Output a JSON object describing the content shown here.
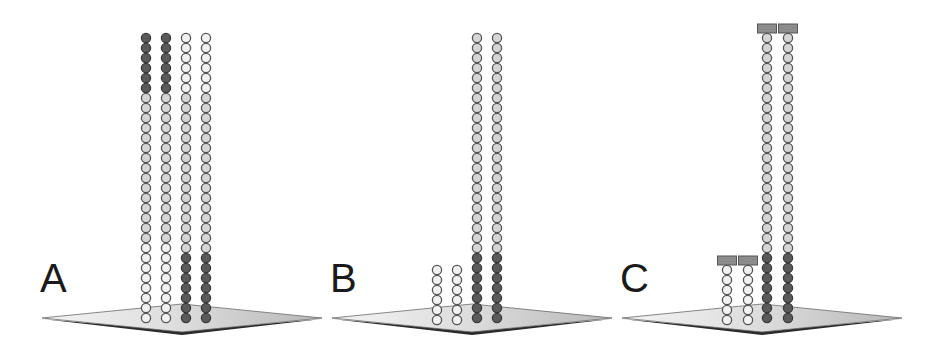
{
  "panels": [
    {
      "label": "A",
      "label_pos": [
        40,
        258
      ],
      "platform": {
        "cx": 182,
        "cy": 318,
        "half_w": 140,
        "half_h": 14
      },
      "columns": [
        {
          "x": 146,
          "top": 38,
          "count": 29,
          "pattern": [
            [
              "dark",
              6
            ],
            [
              "light",
              15
            ],
            [
              "white",
              8
            ]
          ],
          "cap": false
        },
        {
          "x": 166,
          "top": 38,
          "count": 29,
          "pattern": [
            [
              "dark",
              6
            ],
            [
              "light",
              15
            ],
            [
              "white",
              8
            ]
          ],
          "cap": false
        },
        {
          "x": 186,
          "top": 38,
          "count": 29,
          "pattern": [
            [
              "white",
              6
            ],
            [
              "light",
              16
            ],
            [
              "dark",
              7
            ]
          ],
          "cap": false
        },
        {
          "x": 206,
          "top": 38,
          "count": 29,
          "pattern": [
            [
              "white",
              6
            ],
            [
              "light",
              16
            ],
            [
              "dark",
              7
            ]
          ],
          "cap": false
        }
      ]
    },
    {
      "label": "B",
      "label_pos": [
        330,
        258
      ],
      "platform": {
        "cx": 472,
        "cy": 318,
        "half_w": 140,
        "half_h": 14
      },
      "columns": [
        {
          "x": 437,
          "top": 270,
          "count": 6,
          "pattern": [
            [
              "white",
              6
            ]
          ],
          "cap": false
        },
        {
          "x": 457,
          "top": 270,
          "count": 6,
          "pattern": [
            [
              "white",
              6
            ]
          ],
          "cap": false
        },
        {
          "x": 477,
          "top": 38,
          "count": 29,
          "pattern": [
            [
              "light",
              22
            ],
            [
              "dark",
              7
            ]
          ],
          "cap": false
        },
        {
          "x": 497,
          "top": 38,
          "count": 29,
          "pattern": [
            [
              "light",
              22
            ],
            [
              "dark",
              7
            ]
          ],
          "cap": false
        }
      ]
    },
    {
      "label": "C",
      "label_pos": [
        620,
        258
      ],
      "platform": {
        "cx": 762,
        "cy": 318,
        "half_w": 140,
        "half_h": 14
      },
      "columns": [
        {
          "x": 727,
          "top": 270,
          "count": 6,
          "pattern": [
            [
              "white",
              6
            ]
          ],
          "cap": true
        },
        {
          "x": 748,
          "top": 270,
          "count": 6,
          "pattern": [
            [
              "white",
              6
            ]
          ],
          "cap": true
        },
        {
          "x": 767,
          "top": 38,
          "count": 29,
          "pattern": [
            [
              "light",
              22
            ],
            [
              "dark",
              7
            ]
          ],
          "cap": true
        },
        {
          "x": 788,
          "top": 38,
          "count": 29,
          "pattern": [
            [
              "light",
              22
            ],
            [
              "dark",
              7
            ]
          ],
          "cap": true
        }
      ]
    }
  ],
  "bead": {
    "pitch": 10,
    "radius": 4.6
  },
  "colors": {
    "dark_fill": "#5a5a5a",
    "dark_stroke": "#3a3a3a",
    "light_fill": "#d6d6d6",
    "light_stroke": "#555555",
    "white_fill": "#f2f2f2",
    "white_stroke": "#555555",
    "cap_fill": "#8c8c8c",
    "cap_stroke": "#555555",
    "platform_top_light": "#f4f4f4",
    "platform_top_dark": "#b8b8b8",
    "platform_edge": "#2a2a2a"
  }
}
